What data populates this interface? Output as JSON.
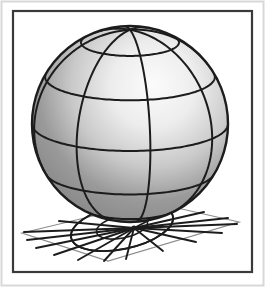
{
  "figure": {
    "kind": "3d-sphere-wireframe-illustration",
    "title": "Shaded sphere with latitude-longitude grid resting on a ground plane",
    "caption": "",
    "width": 265,
    "height": 287
  },
  "canvas": {
    "background_color": "#ffffff",
    "width": 265,
    "height": 287
  },
  "outer_frame": {
    "name": "outer-page-border",
    "x": 1.5,
    "y": 1.5,
    "width": 262,
    "height": 284,
    "stroke_color": "#d8d8d8",
    "stroke_width": 2,
    "fill_color": "#ffffff"
  },
  "inner_frame": {
    "name": "inner-figure-border",
    "x": 13,
    "y": 11,
    "width": 239,
    "height": 261,
    "stroke_color": "#3a3a3a",
    "stroke_width": 2.2,
    "fill_color": "#ffffff"
  },
  "sphere": {
    "name": "shaded-sphere",
    "center_x": 130,
    "center_y": 124,
    "radius": 98,
    "outline_color": "#1c1c1c",
    "outline_width": 2.4,
    "highlight_x_pct": 62,
    "highlight_y_pct": 30,
    "highlight_color": "#fbfbfb",
    "midtone_color": "#c9c9c9",
    "shadow_color": "#9a9a9a",
    "rim_color": "#8c8c8c",
    "grid_color": "#1c1c1c",
    "grid_width": 2.0,
    "meridian_count": 8,
    "parallel_count": 5,
    "meridian_phase_deg": 12,
    "tilt_deg": 16
  },
  "ground_plane": {
    "name": "ground-plane",
    "stroke_color": "#8d8d8d",
    "stroke_width": 1.2,
    "fill_color": "#ffffff",
    "corners": [
      {
        "x": 22,
        "y": 233
      },
      {
        "x": 151,
        "y": 202
      },
      {
        "x": 239,
        "y": 222
      },
      {
        "x": 108,
        "y": 261
      }
    ]
  },
  "contact_point": {
    "name": "sphere-ground-contact-point",
    "x": 134,
    "y": 228
  },
  "radial_lines": {
    "name": "ground-radial-lines",
    "stroke_color": "#1c1c1c",
    "stroke_width": 1.9,
    "count": 15,
    "endpoints": [
      {
        "x": 24,
        "y": 232
      },
      {
        "x": 27,
        "y": 240
      },
      {
        "x": 36,
        "y": 248
      },
      {
        "x": 54,
        "y": 255
      },
      {
        "x": 78,
        "y": 260
      },
      {
        "x": 104,
        "y": 261
      },
      {
        "x": 126,
        "y": 259
      },
      {
        "x": 163,
        "y": 251
      },
      {
        "x": 196,
        "y": 242
      },
      {
        "x": 222,
        "y": 233
      },
      {
        "x": 237,
        "y": 224
      },
      {
        "x": 228,
        "y": 218
      },
      {
        "x": 204,
        "y": 212
      },
      {
        "x": 175,
        "y": 207
      },
      {
        "x": 59,
        "y": 221
      }
    ]
  },
  "shadow_ellipse": {
    "name": "sphere-contact-shadow-ellipse",
    "center_x": 122,
    "center_y": 227,
    "rx": 52,
    "ry": 22,
    "rotation_deg": -12,
    "stroke_color": "#1c1c1c",
    "stroke_width": 1.9,
    "fill_color": "none"
  },
  "projection_rings": {
    "name": "ground-projection-rings",
    "stroke_color": "#1c1c1c",
    "stroke_width": 1.6,
    "rings": [
      {
        "rx": 26,
        "ry": 11
      },
      {
        "rx": 52,
        "ry": 22
      }
    ]
  }
}
